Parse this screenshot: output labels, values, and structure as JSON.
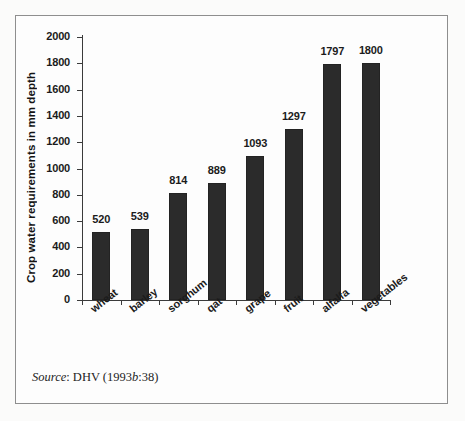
{
  "figure": {
    "source_prefix": "Source",
    "source_sep": ": DHV (1993",
    "source_italic_b": "b",
    "source_suffix": ":38)"
  },
  "chart_data": {
    "type": "bar",
    "title": "",
    "xlabel": "",
    "ylabel": "Crop water requirements in mm depth",
    "categories": [
      "wheat",
      "barley",
      "sorghum",
      "qat",
      "grape",
      "fruit",
      "alfalfa",
      "vegetables"
    ],
    "values": [
      520,
      539,
      814,
      889,
      1093,
      1297,
      1797,
      1800
    ],
    "value_labels": [
      "520",
      "539",
      "814",
      "889",
      "1093",
      "1297",
      "1797",
      "1800"
    ],
    "ylim": [
      0,
      2000
    ],
    "ytick_values": [
      0,
      200,
      400,
      600,
      800,
      1000,
      1200,
      1400,
      1600,
      1800,
      2000
    ],
    "ytick_labels": [
      "0",
      "200",
      "400",
      "600",
      "800",
      "1000",
      "1200",
      "1400",
      "1600",
      "1800",
      "2000"
    ],
    "grid": false,
    "legend": false,
    "bar_color": "#2b2b2b",
    "axis_color": "#3b3b3b"
  }
}
